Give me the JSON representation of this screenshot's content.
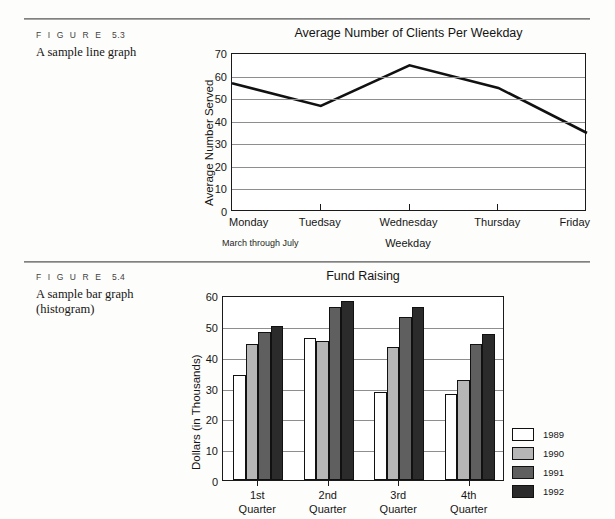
{
  "page": {
    "background": "#fdfdfb",
    "rules": [
      "rule-top",
      "rule-mid"
    ]
  },
  "figures": [
    {
      "id": "5.3",
      "figure_word": "F I G U R E",
      "number": "5.3",
      "description": "A sample line graph"
    },
    {
      "id": "5.4",
      "figure_word": "F I G U R E",
      "number": "5.4",
      "description_line1": "A sample bar graph",
      "description_line2": "(histogram)"
    }
  ],
  "chart_data": [
    {
      "type": "line",
      "title": "Average Number of Clients Per Weekday",
      "xlabel": "Weekday",
      "ylabel": "Average Number Served",
      "note": "March through July",
      "categories": [
        "Monday",
        "Tuedsay",
        "Wednesday",
        "Thursday",
        "Friday"
      ],
      "values": [
        57,
        47,
        65,
        55,
        35
      ],
      "yticks": [
        0,
        10,
        20,
        30,
        40,
        50,
        60,
        70
      ],
      "ylim": [
        0,
        70
      ],
      "grid": true,
      "legend": "none",
      "line_color": "#111111"
    },
    {
      "type": "bar",
      "title": "Fund Raising",
      "xlabel": "",
      "ylabel": "Dollars (in Thousands)",
      "categories": [
        "1st Quarter",
        "2nd Quarter",
        "3rd Quarter",
        "4th Quarter"
      ],
      "category_lines": [
        {
          "top": "1st",
          "bottom": "Quarter"
        },
        {
          "top": "2nd",
          "bottom": "Quarter"
        },
        {
          "top": "3rd",
          "bottom": "Quarter"
        },
        {
          "top": "4th",
          "bottom": "Quarter"
        }
      ],
      "series": [
        {
          "name": "1989",
          "color": "#ffffff",
          "values": [
            34,
            46,
            28.5,
            28
          ]
        },
        {
          "name": "1990",
          "color": "#b6b6b6",
          "values": [
            44,
            45,
            43,
            32.5
          ]
        },
        {
          "name": "1991",
          "color": "#5f5f5f",
          "values": [
            48,
            56,
            53,
            44
          ]
        },
        {
          "name": "1992",
          "color": "#2b2b2b",
          "values": [
            50,
            58,
            56,
            47.5
          ]
        }
      ],
      "yticks": [
        0,
        10,
        20,
        30,
        40,
        50,
        60
      ],
      "ylim": [
        0,
        60
      ],
      "grid": true,
      "legend": "right"
    }
  ]
}
